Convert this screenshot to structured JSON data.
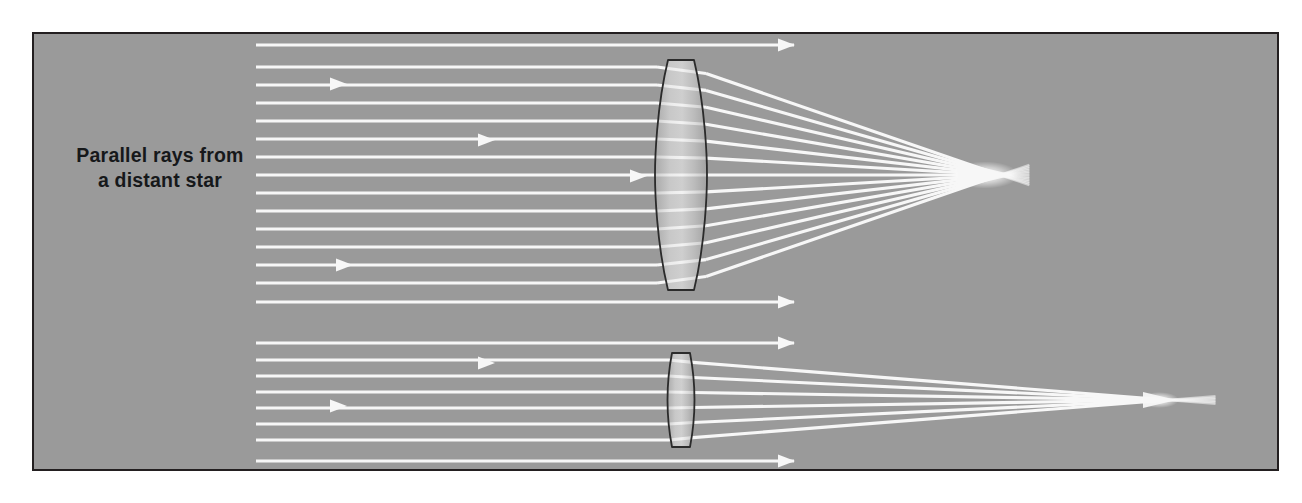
{
  "figure": {
    "kind": "optics-ray-diagram",
    "panel": {
      "background_color": "#9a9a9a",
      "border_color": "#231f20",
      "border_width": 2,
      "x": 33,
      "y": 33,
      "width": 1245,
      "height": 437
    },
    "canvas": {
      "width": 1302,
      "height": 503,
      "background_color": "#ffffff"
    }
  },
  "labels": {
    "source_label": {
      "line1": "Parallel rays from",
      "line2": "a distant star",
      "color": "#16181a",
      "x": 160,
      "y": 162
    }
  },
  "optics": {
    "ray_color": "#f7f7f7",
    "ray_width": 3.1,
    "lens_stroke": "#2b2b2b",
    "lens_fill_light": "#e8e8e8",
    "lens_fill_dark": "#a8a8a8",
    "ray_origin_x": 256,
    "systems": [
      {
        "name": "long-focal-length-lens",
        "id": "upper",
        "lens": {
          "name": "large-biconvex-lens",
          "center_x": 681,
          "top_y": 60,
          "bottom_y": 290,
          "half_height": 115,
          "edge_thickness": 26,
          "flat_cap_half_width": 13,
          "left_x": 655,
          "right_x": 707
        },
        "focal_point": {
          "x": 1000,
          "y": 175
        },
        "axis_y": 175,
        "refracted_ray_heights": [
          -108,
          -90,
          -72,
          -54,
          -36,
          -18,
          0,
          18,
          36,
          54,
          72,
          90,
          108
        ],
        "bypass_rays": [
          {
            "y": 45,
            "arrow_x": 778
          },
          {
            "y": 302,
            "arrow_x": 778
          }
        ],
        "incoming_arrows": [
          {
            "x": 330,
            "y": 84
          },
          {
            "x": 478,
            "y": 140
          },
          {
            "x": 630,
            "y": 176
          },
          {
            "x": 336,
            "y": 265
          }
        ]
      },
      {
        "name": "short-focal-length-lens",
        "id": "lower",
        "lens": {
          "name": "small-biconvex-lens",
          "center_x": 681,
          "top_y": 355,
          "bottom_y": 450,
          "half_height": 47,
          "edge_thickness": 16,
          "flat_cap_half_width": 9,
          "left_x": 667,
          "right_x": 694
        },
        "focal_point": {
          "x": 1168,
          "y": 400
        },
        "axis_y": 400,
        "refracted_ray_heights": [
          -40,
          -24,
          -8,
          8,
          24,
          40
        ],
        "bypass_rays": [
          {
            "y": 343,
            "arrow_x": 778
          },
          {
            "y": 461,
            "arrow_x": 778
          }
        ],
        "incoming_arrows": [
          {
            "x": 478,
            "y": 363
          },
          {
            "x": 330,
            "y": 406
          }
        ]
      }
    ]
  }
}
